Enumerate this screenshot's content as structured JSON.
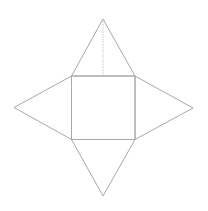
{
  "diagram": {
    "type": "square-pyramid-net",
    "stroke_color": "#a8a8a8",
    "dash_color": "#c8c8c8",
    "background": "#ffffff",
    "square": {
      "x1": 71.5,
      "y1": 76,
      "x2": 135,
      "y2": 139.5
    },
    "apexes": {
      "top": {
        "x": 103,
        "y": 19
      },
      "left": {
        "x": 14,
        "y": 107.5
      },
      "right": {
        "x": 193,
        "y": 108
      },
      "bottom": {
        "x": 103,
        "y": 196
      }
    },
    "height_line": {
      "x1": 103,
      "y1": 19,
      "x2": 103,
      "y2": 76
    }
  }
}
